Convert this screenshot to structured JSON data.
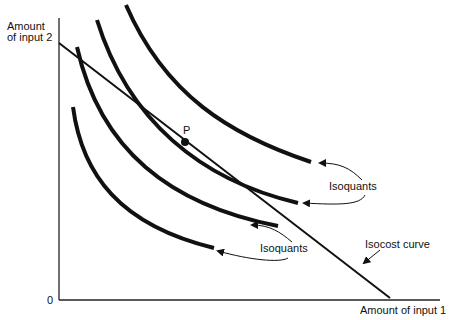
{
  "diagram": {
    "type": "isoquant-isocost",
    "y_axis_label_line1": "Amount",
    "y_axis_label_line2": "of input 2",
    "x_axis_label": "Amount of input 1",
    "origin_label": "0",
    "point_label": "P",
    "isoquants_label_upper": "Isoquants",
    "isoquants_label_lower": "Isoquants",
    "isocost_label": "Isocost curve",
    "isoquant_count": 4,
    "colors": {
      "line": "#111111",
      "background": "#ffffff"
    }
  }
}
